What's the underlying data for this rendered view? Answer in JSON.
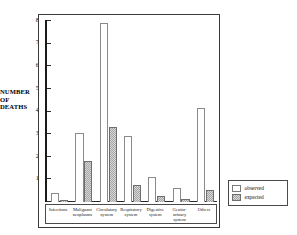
{
  "chart_data": {
    "type": "bar",
    "title": "",
    "subtitle": "",
    "xlabel": "",
    "ylabel": "NUMBER OF DEATHS",
    "ylim": [
      0,
      80
    ],
    "yticks": [
      0,
      10,
      20,
      30,
      40,
      50,
      60,
      70,
      80
    ],
    "ytick_labels": [
      "0",
      "10",
      "20",
      "30",
      "40",
      "50",
      "60",
      "70",
      "80"
    ],
    "grid": false,
    "legend_position": "outside-right-bottom",
    "categories": [
      "Infections",
      "Malignant neoplasms",
      "Circulatory system",
      "Respiratory system",
      "Digestive system",
      "Genito-urinary system",
      "Others"
    ],
    "category_lines": [
      [
        "Infections",
        ""
      ],
      [
        "Malignant",
        "neoplasms"
      ],
      [
        "Circulatory",
        "system"
      ],
      [
        "Respiratory",
        "system"
      ],
      [
        "Digestive",
        "system"
      ],
      [
        "Genito-",
        "urinary system"
      ],
      [
        "Others",
        ""
      ]
    ],
    "series": [
      {
        "name": "observed",
        "fill": "#ffffff",
        "values": [
          4,
          30.5,
          79,
          29,
          11,
          6,
          41.5
        ]
      },
      {
        "name": "expected",
        "fill": "#a6a6a6",
        "values": [
          1,
          18,
          33,
          7.5,
          2.5,
          1.5,
          5.5
        ]
      }
    ]
  },
  "legend": {
    "items": [
      {
        "label": "observed",
        "swatch": "open-square-swatch"
      },
      {
        "label": "expected",
        "swatch": "hatched-square-swatch"
      }
    ]
  },
  "axis": {
    "y_title_line1": "NUMBER",
    "y_title_line2": "OF DEATHS"
  },
  "colors": {
    "observed_fill": "#ffffff",
    "expected_fill": "#a6a6a6",
    "axis": "#1a1a1a",
    "frame": "#3a3a3a",
    "text": "#111111"
  }
}
